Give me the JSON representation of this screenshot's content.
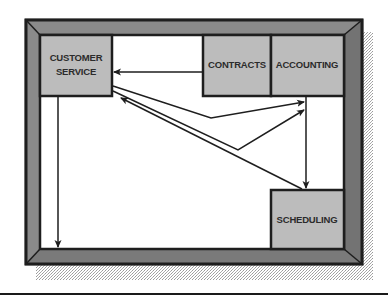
{
  "diagram": {
    "type": "office-floor-plan-flow",
    "colors": {
      "frame": "#7a7a7a",
      "frame_outline": "#1e1e1e",
      "box_fill": "#bcbcbc",
      "interior": "#ffffff",
      "arrow": "#1e1e1e",
      "shadow": "#cfcfcf"
    },
    "departments": [
      {
        "id": "customer_service",
        "label_lines": [
          "CUSTOMER",
          "SERVICE"
        ],
        "x": 40,
        "y": 35,
        "w": 72,
        "h": 61
      },
      {
        "id": "contracts",
        "label_lines": [
          "CONTRACTS"
        ],
        "x": 203,
        "y": 35,
        "w": 68,
        "h": 61
      },
      {
        "id": "accounting",
        "label_lines": [
          "ACCOUNTING"
        ],
        "x": 271,
        "y": 35,
        "w": 73,
        "h": 61
      },
      {
        "id": "scheduling",
        "label_lines": [
          "SCHEDULING"
        ],
        "x": 271,
        "y": 190,
        "w": 73,
        "h": 59
      }
    ],
    "flows": [
      {
        "from": "contracts",
        "to": "customer_service"
      },
      {
        "from": "customer_service",
        "to": "accounting",
        "via": "upper path"
      },
      {
        "from": "customer_service",
        "to": "accounting",
        "via": "lower path"
      },
      {
        "from": "accounting",
        "to": "scheduling"
      },
      {
        "from": "scheduling",
        "to": "customer_service"
      },
      {
        "from": "customer_service",
        "to": "bottom wall"
      }
    ]
  }
}
